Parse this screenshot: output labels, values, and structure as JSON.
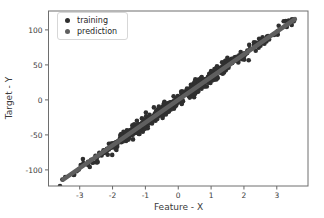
{
  "chart_data": {
    "type": "scatter",
    "title": "",
    "xlabel": "Feature - X",
    "ylabel": "Target - Y",
    "xlim": [
      -3.95,
      3.95
    ],
    "ylim": [
      -123,
      127
    ],
    "x_ticks": [
      -3,
      -2,
      -1,
      0,
      1,
      2,
      3
    ],
    "y_ticks": [
      -100,
      -50,
      0,
      50,
      100
    ],
    "grid": false,
    "background": "#ffffff",
    "spine_color": "#6e6e6e",
    "tick_color": "#555555",
    "tick_label_color": "#3a3a3a",
    "legend": {
      "position": "upper-left",
      "entries": [
        {
          "label": "training",
          "color": "#2f2f2f",
          "marker": "dot"
        },
        {
          "label": "prediction",
          "color": "#5f5f5f",
          "marker": "dot"
        }
      ]
    },
    "series": [
      {
        "name": "training",
        "kind": "scatter",
        "color": "#2f2f2f",
        "marker_radius_px": 2.3,
        "n_points": 650,
        "seed": 7,
        "model": {
          "slope": 32.5,
          "intercept": 0,
          "noise_std": 4.5
        },
        "x_distribution": {
          "normal_frac": 0.8,
          "normal_std": 1.15,
          "uniform_min": -3.5,
          "uniform_max": 3.58,
          "clip_min": -3.6,
          "clip_max": 3.6
        }
      },
      {
        "name": "prediction",
        "kind": "line",
        "color": "#5f5f5f",
        "line_width_px": 4.5,
        "model": {
          "slope": 32.5,
          "intercept": 0,
          "x_min": -3.5,
          "x_max": 3.55
        }
      }
    ]
  }
}
